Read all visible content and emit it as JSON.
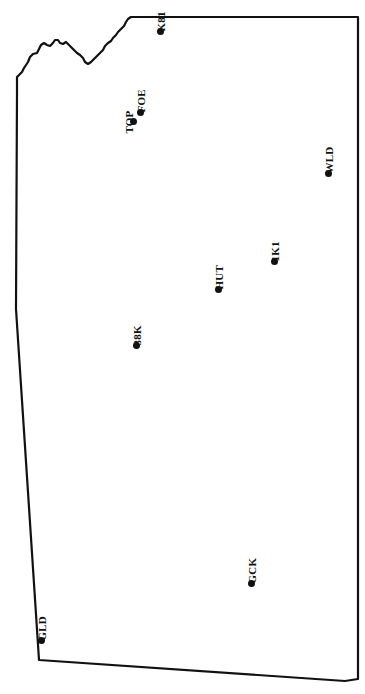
{
  "figure": {
    "background_color": "#ffffff",
    "outline_color": "#111111",
    "marker_color": "#111111",
    "orientation_note": "labels rotated 90 degrees counter-clockwise"
  },
  "chart_data": {
    "type": "scatter",
    "title": "",
    "xlabel": "",
    "ylabel": "",
    "xlim": [
      0,
      365
    ],
    "ylim": [
      0,
      694
    ],
    "grid": false,
    "legend": null,
    "categories": [
      "K81",
      "FOE",
      "TOP",
      "WLD",
      "1K1",
      "HUT",
      "38K",
      "GCK",
      "GLD"
    ],
    "points": [
      {
        "label": "K81",
        "x": 160,
        "y": 31
      },
      {
        "label": "FOE",
        "x": 140,
        "y": 112
      },
      {
        "label": "TOP",
        "x": 133,
        "y": 121
      },
      {
        "label": "WLD",
        "x": 328,
        "y": 173
      },
      {
        "label": "1K1",
        "x": 274,
        "y": 261
      },
      {
        "label": "HUT",
        "x": 218,
        "y": 289
      },
      {
        "label": "38K",
        "x": 136,
        "y": 345
      },
      {
        "label": "GCK",
        "x": 251,
        "y": 583
      },
      {
        "label": "GLD",
        "x": 41,
        "y": 640
      }
    ],
    "outline_path": "M 358,17 L 358,679 L 345,681 L 39,660 L 16,309 L 17,92 L 17,77 L 22,72 L 24,68 L 28,62 L 30,57 L 33,54 L 37,53 L 39,49 L 41,45 L 44,43 L 47,45 L 50,46 L 53,43 L 55,40 L 58,40 L 60,43 L 63,44 L 66,42 L 68,44 L 71,47 L 74,50 L 77,53 L 80,55 L 83,58 L 85,62 L 88,64 L 91,62 L 94,59 L 97,56 L 100,53 L 103,50 L 105,46 L 108,43 L 111,41 L 113,38 L 116,35 L 118,32 L 121,29 L 124,26 L 126,22 L 128,19 L 131,17 Z"
  },
  "stations": [
    {
      "code": "K81",
      "dot_x": 160,
      "dot_y": 31
    },
    {
      "code": "FOE",
      "dot_x": 140,
      "dot_y": 112
    },
    {
      "code": "TOP",
      "dot_x": 133,
      "dot_y": 121
    },
    {
      "code": "WLD",
      "dot_x": 328,
      "dot_y": 173
    },
    {
      "code": "1K1",
      "dot_x": 274,
      "dot_y": 261
    },
    {
      "code": "HUT",
      "dot_x": 218,
      "dot_y": 289
    },
    {
      "code": "38K",
      "dot_x": 136,
      "dot_y": 345
    },
    {
      "code": "GCK",
      "dot_x": 251,
      "dot_y": 583
    },
    {
      "code": "GLD",
      "dot_x": 41,
      "dot_y": 640
    }
  ]
}
